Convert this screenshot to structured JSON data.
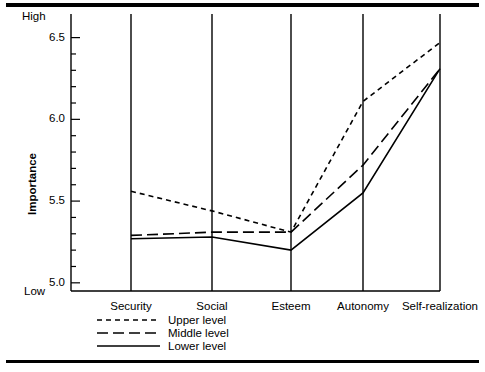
{
  "chart_data": {
    "type": "line",
    "title": "",
    "xlabel": "",
    "ylabel": "Importance",
    "categories": [
      "Security",
      "Social",
      "Esteem",
      "Autonomy",
      "Self-realization"
    ],
    "ylim": [
      4.95,
      6.62
    ],
    "yticks_labeled": [
      "5.0",
      "5.5",
      "6.0",
      "6.5"
    ],
    "ytick_values": [
      5.0,
      5.5,
      6.0,
      6.5
    ],
    "ytick_minor_step": 0.1,
    "y_high_label": "High",
    "y_low_label": "Low",
    "grid": false,
    "legend_position": "below-axis-left",
    "series": [
      {
        "name": "Upper level",
        "style": "short-dash",
        "values": [
          5.56,
          5.44,
          5.31,
          6.11,
          6.47
        ]
      },
      {
        "name": "Middle level",
        "style": "long-dash",
        "values": [
          5.29,
          5.31,
          5.31,
          5.72,
          6.31
        ]
      },
      {
        "name": "Lower level",
        "style": "solid",
        "values": [
          5.27,
          5.28,
          5.2,
          5.55,
          6.31
        ]
      }
    ]
  },
  "axis": {
    "y_title": "Importance",
    "high": "High",
    "low": "Low",
    "ytick_labels": [
      "6.5",
      "6.0",
      "5.5",
      "5.0"
    ]
  },
  "categories": {
    "c0": "Security",
    "c1": "Social",
    "c2": "Esteem",
    "c3": "Autonomy",
    "c4": "Self-realization"
  },
  "legend": {
    "items": [
      {
        "label": "Upper level"
      },
      {
        "label": "Middle level"
      },
      {
        "label": "Lower level"
      }
    ]
  },
  "colors": {
    "ink": "#000000",
    "paper": "#ffffff"
  }
}
